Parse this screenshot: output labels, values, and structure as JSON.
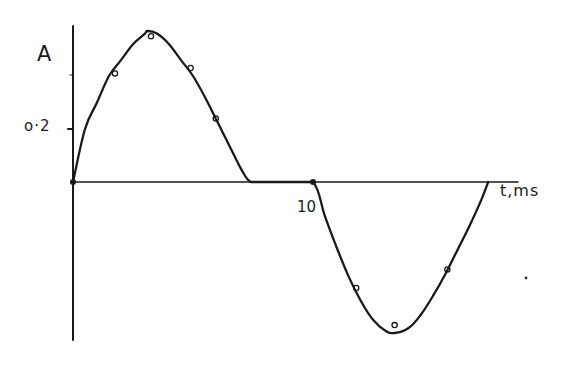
{
  "chart_data": {
    "type": "line",
    "title": "",
    "xlabel": "t,ms",
    "ylabel": "A",
    "x_ticks": [
      {
        "value": 10,
        "label": "10"
      }
    ],
    "y_ticks": [
      {
        "value": 0.2,
        "label": "0.2"
      }
    ],
    "xlim": [
      0,
      18.5
    ],
    "ylim": [
      -0.6,
      0.6
    ],
    "grid": false,
    "legend": null,
    "style": "hand-drawn, black ink on white",
    "series": [
      {
        "name": "fitted curve",
        "kind": "line",
        "x": [
          0,
          0.5,
          1,
          1.5,
          2,
          2.5,
          3,
          3.1,
          3.5,
          4,
          4.5,
          5,
          5.5,
          6,
          6.5,
          7,
          7.4,
          8,
          9,
          10,
          10.5,
          11,
          11.5,
          12,
          12.5,
          13,
          13.4,
          14,
          14.5,
          15,
          15.5,
          16,
          16.5,
          17,
          17.3
        ],
        "y": [
          0,
          0.2,
          0.3,
          0.4,
          0.46,
          0.52,
          0.56,
          0.57,
          0.56,
          0.52,
          0.46,
          0.4,
          0.32,
          0.23,
          0.14,
          0.05,
          0,
          0,
          0,
          0,
          -0.13,
          -0.25,
          -0.36,
          -0.45,
          -0.52,
          -0.56,
          -0.57,
          -0.55,
          -0.5,
          -0.43,
          -0.35,
          -0.26,
          -0.17,
          -0.07,
          0
        ]
      },
      {
        "name": "measured points",
        "kind": "scatter",
        "marker": "open-circle",
        "x": [
          1.75,
          3.25,
          4.9,
          5.95,
          11.8,
          13.4,
          15.6
        ],
        "y": [
          0.41,
          0.55,
          0.43,
          0.24,
          -0.4,
          -0.54,
          -0.33
        ]
      }
    ],
    "annotations": [
      {
        "type": "filled-dot",
        "x": 0,
        "y": 0
      },
      {
        "type": "filled-dot",
        "x": 10,
        "y": 0
      }
    ]
  },
  "labels": {
    "ylabel": "A",
    "ytick": "o·2",
    "xtick": "10",
    "xlabel": "t,ms"
  },
  "colors": {
    "ink": "#1a1a1a",
    "background": "#ffffff"
  }
}
